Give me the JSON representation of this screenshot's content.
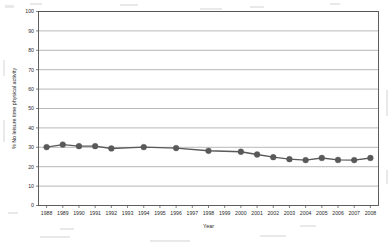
{
  "chart_data": {
    "type": "line",
    "title": "",
    "subtitle": "",
    "xlabel": "Year",
    "ylabel": "% No leisure time physical activity",
    "x": [
      1988,
      1989,
      1990,
      1991,
      1992,
      1993,
      1994,
      1995,
      1996,
      1997,
      1998,
      1999,
      2000,
      2001,
      2002,
      2003,
      2004,
      2005,
      2006,
      2007,
      2008
    ],
    "xtick_labels": [
      "1988",
      "1989",
      "1990",
      "1991",
      "1992",
      "1993",
      "1994",
      "1995",
      "1996",
      "1997",
      "1998",
      "1999",
      "2000",
      "2001",
      "2002",
      "2003",
      "2004",
      "2005",
      "2006",
      "2007",
      "2008"
    ],
    "ytick_labels": [
      "0",
      "10",
      "20",
      "30",
      "40",
      "50",
      "60",
      "70",
      "80",
      "90",
      "100"
    ],
    "ylim": [
      0,
      100
    ],
    "ytick_step": 10,
    "xlim": [
      1987.5,
      2008.5
    ],
    "grid": "horizontal",
    "legend": "none",
    "series": [
      {
        "name": "% No leisure time physical activity",
        "color": "#595959",
        "marker": "circle",
        "values": [
          30.1,
          31.4,
          30.6,
          30.6,
          29.4,
          null,
          30.1,
          null,
          29.6,
          null,
          28.2,
          null,
          27.7,
          26.3,
          24.9,
          23.9,
          23.4,
          24.5,
          23.5,
          23.4,
          24.5
        ]
      }
    ],
    "points": [
      {
        "year": "1988",
        "value": 30.1
      },
      {
        "year": "1989",
        "value": 31.4
      },
      {
        "year": "1990",
        "value": 30.6
      },
      {
        "year": "1991",
        "value": 30.6
      },
      {
        "year": "1992",
        "value": 29.4
      },
      {
        "year": "1994",
        "value": 30.1
      },
      {
        "year": "1996",
        "value": 29.6
      },
      {
        "year": "1998",
        "value": 28.2
      },
      {
        "year": "2000",
        "value": 27.7
      },
      {
        "year": "2001",
        "value": 26.3
      },
      {
        "year": "2002",
        "value": 24.9
      },
      {
        "year": "2003",
        "value": 23.9
      },
      {
        "year": "2004",
        "value": 23.4
      },
      {
        "year": "2005",
        "value": 24.5
      },
      {
        "year": "2006",
        "value": 23.5
      },
      {
        "year": "2007",
        "value": 23.4
      },
      {
        "year": "2008",
        "value": 24.5
      }
    ],
    "colors": {
      "series": "#595959",
      "grid": "#9a9a9a",
      "axis": "#4d4d4d",
      "background": "#ffffff",
      "text": "#2b2b2b"
    }
  }
}
